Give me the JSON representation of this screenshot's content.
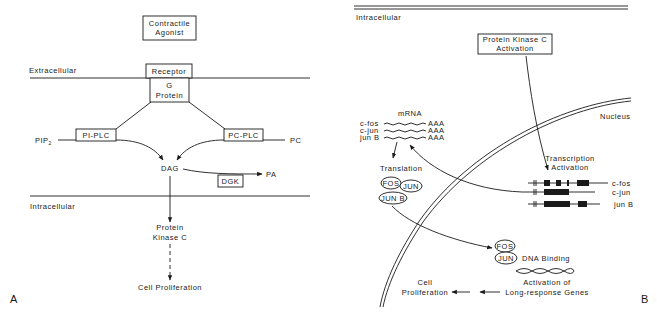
{
  "panel_a": {
    "label": "A",
    "agonist_line1": "Contractile",
    "agonist_line2": "Agonist",
    "extracellular": "Extracellular",
    "intracellular": "Intracellular",
    "receptor": "Receptor",
    "gprotein_line1": "G",
    "gprotein_line2": "Protein",
    "pi_plc": "PI-PLC",
    "pc_plc": "PC-PLC",
    "pip2": "PIP",
    "pip2_sub": "2",
    "pc": "PC",
    "dag": "DAG",
    "dgk": "DGK",
    "pa": "PA",
    "pkc_line1": "Protein",
    "pkc_line2": "Kinase C",
    "cell_proliferation": "Cell Proliferation"
  },
  "panel_b": {
    "label": "B",
    "intracellular": "Intracellular",
    "pkc_line1": "Protein Kinase C",
    "pkc_line2": "Activation",
    "nucleus": "Nucleus",
    "mrna_title": "mRNA",
    "mrna": [
      {
        "gene": "c-fos",
        "tail": "AAA"
      },
      {
        "gene": "c-jun",
        "tail": "AAA"
      },
      {
        "gene": "jun B",
        "tail": "AAA"
      }
    ],
    "translation": "Translation",
    "proteins": [
      "FOS",
      "JUN",
      "JUN B"
    ],
    "transcription_line1": "Transcription",
    "transcription_line2": "Activation",
    "genes": [
      "c-fos",
      "c-jun",
      "jun B"
    ],
    "dna_fos": "FOS",
    "dna_jun": "JUN",
    "dna_binding": "DNA Binding",
    "activation_line1": "Activation of",
    "activation_line2": "Long-response Genes",
    "cell_line1": "Cell",
    "cell_line2": "Proliferation"
  }
}
